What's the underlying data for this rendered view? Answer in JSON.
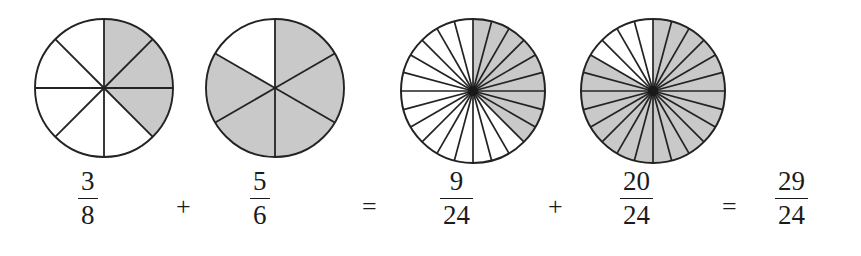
{
  "figure": {
    "background_color": "#ffffff",
    "shade_color": "#c9c9c9",
    "stroke_color": "#232323",
    "text_color": "#1b1b1b"
  },
  "chart_data": {
    "type": "pie",
    "title": "3/8 + 5/6 = 9/24 + 20/24 = 29/24",
    "xlabel": "",
    "ylabel": "",
    "legend": "none",
    "grid": false,
    "circles": [
      {
        "name": "circle-three-eighths",
        "total_sectors": 8,
        "shaded_sectors": 3,
        "unshaded_sectors": 5,
        "fraction": "3/8",
        "numerator": "3",
        "denominator": "8",
        "shaded_start_deg": 0,
        "shaded_end_deg": 135,
        "cx": 101,
        "cy": 85,
        "r": 69
      },
      {
        "name": "circle-five-sixths",
        "total_sectors": 6,
        "shaded_sectors": 5,
        "unshaded_sectors": 1,
        "fraction": "5/6",
        "numerator": "5",
        "denominator": "6",
        "shaded_start_deg": 0,
        "shaded_end_deg": 300,
        "cx": 272,
        "cy": 85,
        "r": 69
      },
      {
        "name": "circle-nine-twentyfourths",
        "total_sectors": 24,
        "shaded_sectors": 9,
        "unshaded_sectors": 15,
        "fraction": "9/24",
        "numerator": "9",
        "denominator": "24",
        "shaded_start_deg": 0,
        "shaded_end_deg": 135,
        "cx": 470,
        "cy": 88,
        "r": 72
      },
      {
        "name": "circle-twenty-twentyfourths",
        "total_sectors": 24,
        "shaded_sectors": 20,
        "unshaded_sectors": 4,
        "fraction": "20/24",
        "numerator": "20",
        "denominator": "24",
        "shaded_start_deg": 0,
        "shaded_end_deg": 300,
        "cx": 650,
        "cy": 88,
        "r": 72
      }
    ]
  },
  "equation": {
    "terms": [
      {
        "kind": "fraction",
        "name": "fraction-3-8",
        "numerator": "3",
        "denominator": "8",
        "x": 78
      },
      {
        "kind": "operator",
        "name": "plus-sign-1",
        "symbol": "+",
        "x": 176
      },
      {
        "kind": "fraction",
        "name": "fraction-5-6",
        "numerator": "5",
        "denominator": "6",
        "x": 250
      },
      {
        "kind": "operator",
        "name": "equals-sign-1",
        "symbol": "=",
        "x": 362
      },
      {
        "kind": "fraction",
        "name": "fraction-9-24",
        "numerator": "9",
        "denominator": "24",
        "x": 440
      },
      {
        "kind": "operator",
        "name": "plus-sign-2",
        "symbol": "+",
        "x": 548
      },
      {
        "kind": "fraction",
        "name": "fraction-20-24",
        "numerator": "20",
        "denominator": "24",
        "x": 620
      },
      {
        "kind": "operator",
        "name": "equals-sign-2",
        "symbol": "=",
        "x": 722
      },
      {
        "kind": "fraction",
        "name": "fraction-29-24",
        "numerator": "29",
        "denominator": "24",
        "x": 775
      }
    ]
  }
}
